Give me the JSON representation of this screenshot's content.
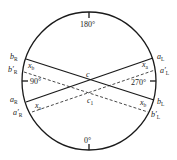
{
  "diagram": {
    "type": "circle-protractor-with-crossing-lines",
    "circle": {
      "cx": 89,
      "cy": 81,
      "rx": 67,
      "ry": 69,
      "stroke": "#1a1a1a"
    },
    "angle_labels": [
      {
        "text": "180°",
        "x": 80,
        "y": 27
      },
      {
        "text": "90°",
        "x": 30,
        "y": 84
      },
      {
        "text": "270°",
        "x": 131,
        "y": 85
      },
      {
        "text": "0°",
        "x": 84,
        "y": 143
      }
    ],
    "ticks": [
      {
        "x1": 89,
        "y1": 12,
        "x2": 89,
        "y2": 18
      },
      {
        "x1": 22,
        "y1": 81,
        "x2": 28,
        "y2": 81
      },
      {
        "x1": 156,
        "y1": 81,
        "x2": 150,
        "y2": 81
      },
      {
        "x1": 89,
        "y1": 150,
        "x2": 89,
        "y2": 144
      }
    ],
    "solid_lines": [
      {
        "name": "bR-bL",
        "x1": 26,
        "y1": 59,
        "x2": 154,
        "y2": 100
      },
      {
        "name": "aR-aL",
        "x1": 26,
        "y1": 102,
        "x2": 153,
        "y2": 58
      }
    ],
    "dashed_lines": [
      {
        "name": "bR'-bL'",
        "x1": 24,
        "y1": 72,
        "x2": 148,
        "y2": 112
      },
      {
        "name": "aR'-aL'",
        "x1": 32,
        "y1": 112,
        "x2": 155,
        "y2": 70
      }
    ],
    "point_labels": [
      {
        "main": "b",
        "sub": "R",
        "prime": "",
        "x": 10,
        "y": 59
      },
      {
        "main": "b",
        "sub": "R",
        "prime": "′",
        "x": 8,
        "y": 72
      },
      {
        "main": "a",
        "sub": "R",
        "prime": "",
        "x": 10,
        "y": 102
      },
      {
        "main": "a",
        "sub": "R",
        "prime": "′",
        "x": 13,
        "y": 115
      },
      {
        "main": "a",
        "sub": "L",
        "prime": "",
        "x": 157,
        "y": 59
      },
      {
        "main": "a",
        "sub": "L",
        "prime": "′",
        "x": 160,
        "y": 73
      },
      {
        "main": "b",
        "sub": "L",
        "prime": "",
        "x": 157,
        "y": 104
      },
      {
        "main": "b",
        "sub": "L",
        "prime": "′",
        "x": 151,
        "y": 117
      },
      {
        "main": "x",
        "sub": "b",
        "prime": "",
        "x": 28,
        "y": 68
      },
      {
        "main": "x",
        "sub": "a",
        "prime": "",
        "x": 142,
        "y": 67
      },
      {
        "main": "x",
        "sub": "a",
        "prime": "",
        "x": 35,
        "y": 108
      },
      {
        "main": "x",
        "sub": "b",
        "prime": "",
        "x": 140,
        "y": 105
      },
      {
        "main": "c",
        "sub": "",
        "prime": "",
        "x": 86,
        "y": 77
      },
      {
        "main": "c",
        "sub": "1",
        "prime": "",
        "x": 87,
        "y": 103
      }
    ]
  }
}
